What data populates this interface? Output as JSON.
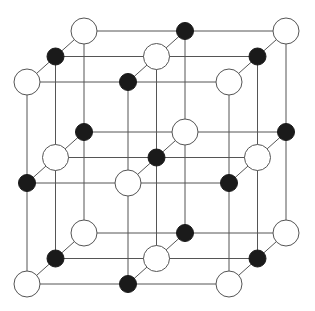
{
  "diagram": {
    "title": "",
    "type": "rock-salt crystal lattice (3x3x3 sites)",
    "grid": {
      "nx": 3,
      "ny": 3,
      "nz": 3
    },
    "projection": {
      "origin": [
        27,
        82
      ],
      "step_x": [
        101,
        0
      ],
      "step_y": [
        0,
        101
      ],
      "step_z": [
        28.5,
        -25.5
      ]
    },
    "atoms": {
      "large": {
        "label": "white ion",
        "radius": 13,
        "fill": "#ffffff",
        "stroke": "#555555"
      },
      "small": {
        "label": "black ion",
        "radius": 8.5,
        "fill": "#1a1a1a",
        "stroke": "#1a1a1a"
      }
    },
    "bond_color": "#555555",
    "bond_width": 1
  }
}
